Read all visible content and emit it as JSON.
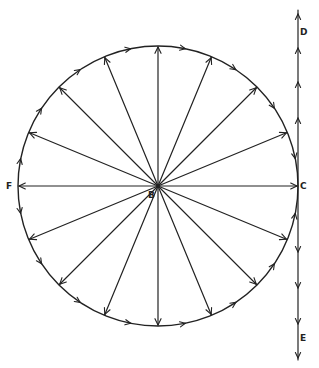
{
  "diagram": {
    "type": "vector-circle",
    "colors": {
      "stroke": "#222222",
      "background": "#ffffff"
    },
    "labels": {
      "center": "B",
      "right": "C",
      "left": "F",
      "top_right": "D",
      "bottom_right": "E"
    },
    "center": [
      158,
      186
    ],
    "radius": 140,
    "spoke_count": 16,
    "spoke_angles_deg": [
      0,
      22.5,
      45,
      67.5,
      90,
      112.5,
      135,
      157.5,
      180,
      202.5,
      225,
      247.5,
      270,
      292.5,
      315,
      337.5
    ]
  }
}
